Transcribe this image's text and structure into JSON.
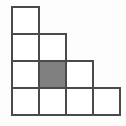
{
  "diagram": {
    "type": "staircase-grid",
    "rows": [
      1,
      2,
      3,
      4
    ],
    "cell_size": 27,
    "origin": {
      "x": 12,
      "y": 7
    },
    "shaded_cells": [
      {
        "row": 3,
        "col": 2
      }
    ],
    "colors": {
      "background": "#fdfdfd",
      "cell_fill": "#ffffff",
      "shaded_fill": "#808080",
      "border": "#4a4a4a"
    }
  }
}
